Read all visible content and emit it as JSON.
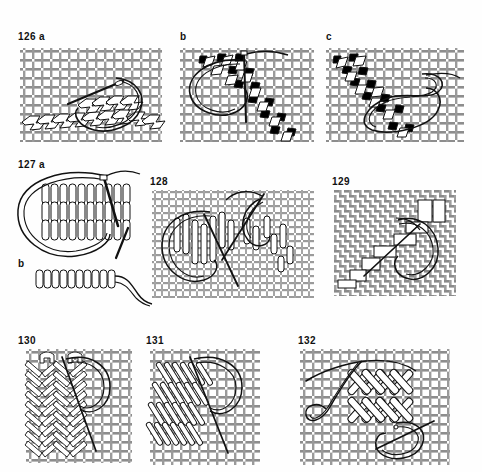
{
  "page": {
    "background": "#ffffff",
    "ink": "#111111",
    "weave_color": "#8d8d8d",
    "thread_fill": "#ffffff",
    "accent_black": "#000000",
    "type": "illustration-plate",
    "caption_style": "bold-numeral"
  },
  "figures": [
    {
      "id": "126a",
      "number": "126",
      "sub": "a",
      "label": "126 a",
      "label_x": 18,
      "label_y": 36,
      "panel": {
        "x": 20,
        "y": 48,
        "w": 140,
        "h": 92
      },
      "fabric": "plain-weave-open",
      "stitch": "knotted-chain-row",
      "shading": "outline",
      "needle": true,
      "thread_loop": true
    },
    {
      "id": "126b",
      "number": "126",
      "sub": "b",
      "label": "b",
      "label_x": 180,
      "label_y": 36,
      "panel": {
        "x": 180,
        "y": 48,
        "w": 132,
        "h": 92
      },
      "fabric": "plain-weave-open",
      "stitch": "knotted-chain-diagonal",
      "shading": "black-filled",
      "needle": true,
      "thread_loop": true
    },
    {
      "id": "126c",
      "number": "126",
      "sub": "c",
      "label": "c",
      "label_x": 326,
      "label_y": 36,
      "panel": {
        "x": 326,
        "y": 48,
        "w": 136,
        "h": 92
      },
      "fabric": "plain-weave-open",
      "stitch": "knotted-chain-turn",
      "shading": "black-filled",
      "needle": false,
      "thread_loop": true
    },
    {
      "id": "127a",
      "number": "127",
      "sub": "a",
      "label": "127 a",
      "label_x": 18,
      "label_y": 166,
      "panel": {
        "x": 20,
        "y": 176,
        "w": 120,
        "h": 80
      },
      "fabric": "none",
      "stitch": "raised-band-rows",
      "shading": "outline",
      "needle": true,
      "thread_loop": true
    },
    {
      "id": "127b",
      "number": "127",
      "sub": "b",
      "label": "b",
      "label_x": 18,
      "label_y": 265,
      "panel": {
        "x": 36,
        "y": 268,
        "w": 104,
        "h": 34
      },
      "fabric": "none",
      "stitch": "raised-cord-single",
      "shading": "outline",
      "needle": false,
      "thread_loop": true
    },
    {
      "id": "128",
      "number": "128",
      "sub": "",
      "label": "128",
      "label_x": 150,
      "label_y": 182,
      "panel": {
        "x": 152,
        "y": 190,
        "w": 160,
        "h": 106
      },
      "fabric": "basket-weave-medium",
      "stitch": "long-straight-vertical",
      "shading": "outline",
      "needle": true,
      "thread_loop": true
    },
    {
      "id": "129",
      "number": "129",
      "sub": "",
      "label": "129",
      "label_x": 332,
      "label_y": 182,
      "panel": {
        "x": 334,
        "y": 190,
        "w": 120,
        "h": 104
      },
      "fabric": "basket-weave-fine",
      "stitch": "stepped-satin-diagonal",
      "shading": "outline",
      "needle": true,
      "thread_loop": true
    },
    {
      "id": "130",
      "number": "130",
      "sub": "",
      "label": "130",
      "label_x": 18,
      "label_y": 341,
      "panel": {
        "x": 26,
        "y": 349,
        "w": 104,
        "h": 112
      },
      "fabric": "plain-weave-open",
      "stitch": "chevron-fill",
      "shading": "outline",
      "needle": true,
      "thread_loop": true
    },
    {
      "id": "131",
      "number": "131",
      "sub": "",
      "label": "131",
      "label_x": 146,
      "label_y": 341,
      "panel": {
        "x": 150,
        "y": 349,
        "w": 108,
        "h": 114
      },
      "fabric": "plain-weave-open",
      "stitch": "diagonal-satin-fill",
      "shading": "outline",
      "needle": true,
      "thread_loop": true
    },
    {
      "id": "132",
      "number": "132",
      "sub": "",
      "label": "132",
      "label_x": 298,
      "label_y": 341,
      "panel": {
        "x": 300,
        "y": 349,
        "w": 148,
        "h": 114
      },
      "fabric": "plain-weave-open",
      "stitch": "interlaced-lattice",
      "shading": "outline",
      "needle": true,
      "thread_loop": true
    }
  ]
}
